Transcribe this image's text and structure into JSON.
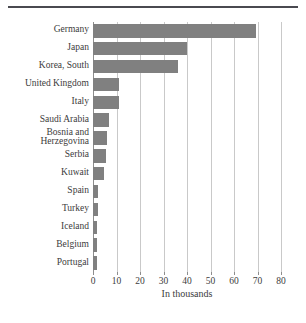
{
  "chart_data": {
    "type": "bar",
    "orientation": "horizontal",
    "title": "",
    "xlabel": "In thousands",
    "ylabel": "",
    "xlim": [
      0,
      80
    ],
    "xticks": [
      0,
      10,
      20,
      30,
      40,
      50,
      60,
      70,
      80
    ],
    "xtick_labels": [
      "0",
      "10",
      "20",
      "30",
      "40",
      "50",
      "60",
      "70",
      "80"
    ],
    "grid": true,
    "legend": false,
    "bar_color": "#808080",
    "gridline_color": "#c9c9c9",
    "categories": [
      "Germany",
      "Japan",
      "Korea, South",
      "United Kingdom",
      "Italy",
      "Saudi Arabia",
      "Bosnia and\nHerzegovina",
      "Serbia",
      "Kuwait",
      "Spain",
      "Turkey",
      "Iceland",
      "Belgium",
      "Portugal"
    ],
    "values": [
      69.4,
      40.0,
      36.3,
      11.2,
      11.0,
      7.0,
      6.0,
      5.5,
      4.5,
      2.0,
      2.0,
      1.7,
      1.8,
      1.5
    ]
  }
}
